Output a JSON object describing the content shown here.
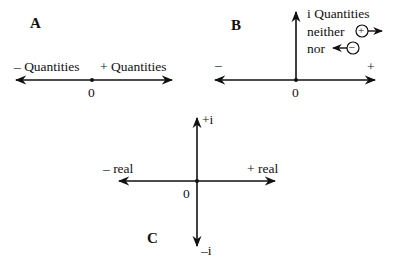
{
  "diagrams": {
    "A": {
      "label": "A",
      "negative_label": "– Quantities",
      "positive_label": "+ Quantities",
      "origin": "0"
    },
    "B": {
      "label": "B",
      "vertical_label": "i Quantities",
      "neither_label": "neither",
      "nor_label": "nor",
      "plus_symbol": "+",
      "minus_symbol": "–",
      "left_sign": "–",
      "right_sign": "+",
      "origin": "0"
    },
    "C": {
      "label": "C",
      "top_label": "+i",
      "bottom_label": "–i",
      "left_label": "– real",
      "right_label": "+ real",
      "origin": "0"
    }
  }
}
